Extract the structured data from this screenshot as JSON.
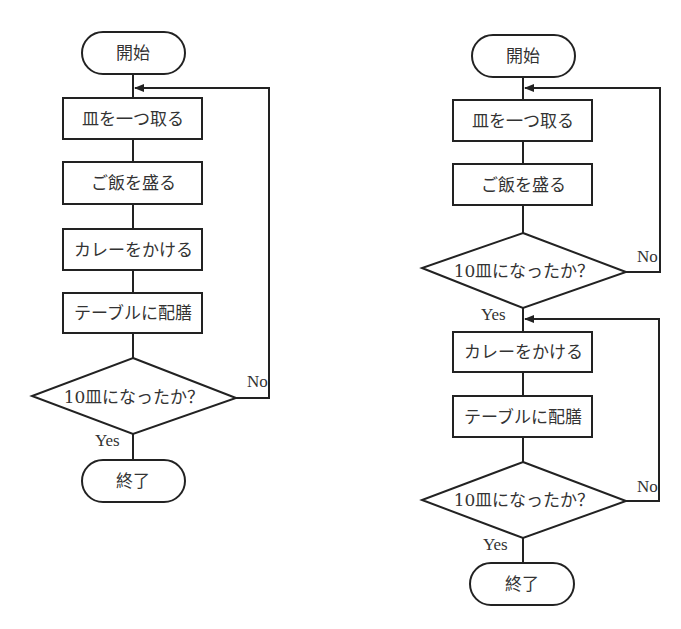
{
  "left_flowchart": {
    "start": "開始",
    "steps": [
      "皿を一つ取る",
      "ご飯を盛る",
      "カレーをかける",
      "テーブルに配膳"
    ],
    "decision": "10皿になったか？",
    "yes_label": "Yes",
    "no_label": "No",
    "end": "終了"
  },
  "right_flowchart": {
    "start": "開始",
    "loop1_steps": [
      "皿を一つ取る",
      "ご飯を盛る"
    ],
    "decision1": "10皿になったか？",
    "decision1_yes": "Yes",
    "decision1_no": "No",
    "loop2_steps": [
      "カレーをかける",
      "テーブルに配膳"
    ],
    "decision2": "10皿になったか？",
    "decision2_yes": "Yes",
    "decision2_no": "No",
    "end": "終了"
  },
  "colors": {
    "stroke": "#222222",
    "text": "#333333",
    "background": "#ffffff"
  }
}
